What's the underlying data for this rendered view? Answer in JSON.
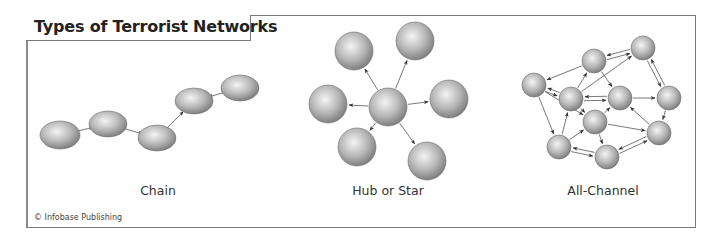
{
  "title": "Types of Terrorist Networks",
  "credit": "© Infobase Publishing",
  "colors": {
    "node_light": "#f4f4f4",
    "node_mid": "#b8b8b8",
    "node_dark": "#7a7a7a",
    "edge": "#555555",
    "frame": "#7a7a7a"
  },
  "networks": [
    {
      "label": "Chain",
      "label_pos": [
        158,
        190
      ],
      "nodes": [
        {
          "id": "c1",
          "x": 60,
          "y": 135,
          "rx": 20,
          "ry": 14
        },
        {
          "id": "c2",
          "x": 108,
          "y": 124,
          "rx": 19,
          "ry": 13
        },
        {
          "id": "c3",
          "x": 157,
          "y": 138,
          "rx": 19,
          "ry": 13
        },
        {
          "id": "c4",
          "x": 194,
          "y": 101,
          "rx": 19,
          "ry": 13
        },
        {
          "id": "c5",
          "x": 240,
          "y": 88,
          "rx": 19,
          "ry": 13
        }
      ],
      "edges": [
        [
          "c1",
          "c2"
        ],
        [
          "c2",
          "c3"
        ],
        [
          "c3",
          "c4"
        ],
        [
          "c5",
          "c4"
        ]
      ]
    },
    {
      "label": "Hub or Star",
      "label_pos": [
        388,
        190
      ],
      "nodes": [
        {
          "id": "h0",
          "x": 388,
          "y": 107,
          "rx": 19,
          "ry": 19
        },
        {
          "id": "h1",
          "x": 354,
          "y": 51,
          "rx": 19,
          "ry": 19
        },
        {
          "id": "h2",
          "x": 415,
          "y": 41,
          "rx": 19,
          "ry": 19
        },
        {
          "id": "h3",
          "x": 328,
          "y": 104,
          "rx": 19,
          "ry": 19
        },
        {
          "id": "h4",
          "x": 449,
          "y": 99,
          "rx": 19,
          "ry": 19
        },
        {
          "id": "h5",
          "x": 357,
          "y": 147,
          "rx": 19,
          "ry": 19
        },
        {
          "id": "h6",
          "x": 427,
          "y": 161,
          "rx": 19,
          "ry": 19
        }
      ],
      "edges": [
        [
          "h0",
          "h1"
        ],
        [
          "h0",
          "h2"
        ],
        [
          "h0",
          "h3"
        ],
        [
          "h0",
          "h4"
        ],
        [
          "h0",
          "h5"
        ],
        [
          "h0",
          "h6"
        ]
      ]
    },
    {
      "label": "All-Channel",
      "label_pos": [
        603,
        190
      ],
      "nodes": [
        {
          "id": "a",
          "x": 534,
          "y": 85,
          "rx": 12,
          "ry": 12
        },
        {
          "id": "b",
          "x": 594,
          "y": 61,
          "rx": 12,
          "ry": 12
        },
        {
          "id": "c",
          "x": 643,
          "y": 48,
          "rx": 12,
          "ry": 12
        },
        {
          "id": "d",
          "x": 571,
          "y": 99,
          "rx": 12,
          "ry": 12
        },
        {
          "id": "e",
          "x": 620,
          "y": 98,
          "rx": 12,
          "ry": 12
        },
        {
          "id": "f",
          "x": 669,
          "y": 98,
          "rx": 12,
          "ry": 12
        },
        {
          "id": "g",
          "x": 595,
          "y": 122,
          "rx": 12,
          "ry": 12
        },
        {
          "id": "h",
          "x": 659,
          "y": 133,
          "rx": 12,
          "ry": 12
        },
        {
          "id": "i",
          "x": 559,
          "y": 147,
          "rx": 12,
          "ry": 12
        },
        {
          "id": "j",
          "x": 607,
          "y": 157,
          "rx": 12,
          "ry": 12
        }
      ],
      "edges": [
        [
          "b",
          "c"
        ],
        [
          "c",
          "b"
        ],
        [
          "b",
          "a"
        ],
        [
          "a",
          "d"
        ],
        [
          "d",
          "a"
        ],
        [
          "d",
          "b"
        ],
        [
          "d",
          "c"
        ],
        [
          "d",
          "e"
        ],
        [
          "e",
          "d"
        ],
        [
          "e",
          "f"
        ],
        [
          "b",
          "e"
        ],
        [
          "c",
          "f"
        ],
        [
          "f",
          "c"
        ],
        [
          "f",
          "h"
        ],
        [
          "a",
          "i"
        ],
        [
          "a",
          "g"
        ],
        [
          "i",
          "d"
        ],
        [
          "i",
          "g"
        ],
        [
          "d",
          "g"
        ],
        [
          "g",
          "e"
        ],
        [
          "g",
          "j"
        ],
        [
          "g",
          "h"
        ],
        [
          "i",
          "j"
        ],
        [
          "j",
          "i"
        ],
        [
          "j",
          "h"
        ],
        [
          "h",
          "j"
        ],
        [
          "h",
          "e"
        ]
      ]
    }
  ]
}
